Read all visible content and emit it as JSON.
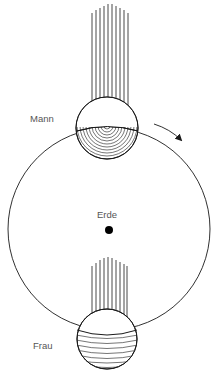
{
  "labels": {
    "man": "Mann",
    "woman": "Frau",
    "earth": "Erde"
  },
  "colors": {
    "stroke": "#1a1a1a",
    "text": "#555555",
    "background": "#ffffff"
  },
  "geometry": {
    "earth_circle": {
      "cx": 109,
      "cy": 229,
      "r": 101
    },
    "earth_center_dot": {
      "cx": 109,
      "cy": 230,
      "r": 4
    },
    "top_sphere": {
      "cx": 107,
      "cy": 128,
      "r": 31
    },
    "bottom_sphere": {
      "cx": 107,
      "cy": 339,
      "r": 30
    },
    "top_rays_count": 10,
    "bottom_rays_count": 9
  },
  "icons": {
    "rotation_arrow": "curved-arrow-clockwise"
  }
}
